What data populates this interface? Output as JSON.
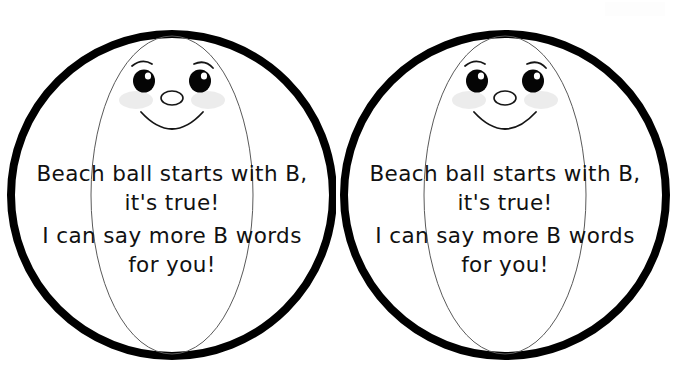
{
  "page": {
    "background_color": "#ffffff",
    "ink_color": "#000000",
    "blush_color": "#ececec",
    "segment_line_color": "#555555",
    "width": 673,
    "height": 382
  },
  "balls": [
    {
      "id": "beach-ball-left",
      "label": "Beach ball cutout left",
      "face": {
        "expression": "smiling",
        "eyes": 2,
        "eyebrows": 2,
        "blush": 2,
        "nose": "oval",
        "mouth": "smile-arc"
      },
      "rhyme": {
        "line1": "Beach ball starts with B,",
        "line2": "it's true!",
        "line3": "I can say more B words",
        "line4": "for you!",
        "emphasis_word": "more",
        "letter": "B"
      }
    },
    {
      "id": "beach-ball-right",
      "label": "Beach ball cutout right",
      "face": {
        "expression": "smiling",
        "eyes": 2,
        "eyebrows": 2,
        "blush": 2,
        "nose": "oval",
        "mouth": "smile-arc"
      },
      "rhyme": {
        "line1": "Beach ball starts with B,",
        "line2": "it's true!",
        "line3": "I can say more B words",
        "line4": "for you!",
        "emphasis_word": "more",
        "letter": "B"
      }
    }
  ]
}
